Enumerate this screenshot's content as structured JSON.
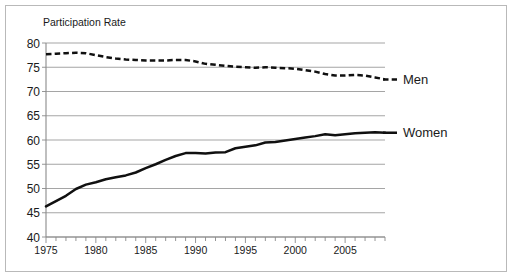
{
  "figure": {
    "title": "Participation Rate",
    "background_color": "#ffffff",
    "frame_color": "#b9b9b9",
    "line_color": "#101010",
    "grid_color": "#9b9b9b"
  },
  "chart_data": {
    "type": "line",
    "title": "Participation Rate",
    "xlabel": "",
    "ylabel": "",
    "ylim": [
      40,
      80
    ],
    "xlim": [
      1975,
      2009
    ],
    "y_ticks": [
      40,
      45,
      50,
      55,
      60,
      65,
      70,
      75,
      80
    ],
    "y_tick_labels": [
      "40",
      "45",
      "50",
      "55",
      "60",
      "65",
      "70",
      "75",
      "80"
    ],
    "x_ticks": [
      1975,
      1980,
      1985,
      1990,
      1995,
      2000,
      2005
    ],
    "x_tick_labels": [
      "1975",
      "1980",
      "1985",
      "1990",
      "1995",
      "2000",
      "2005"
    ],
    "x_minor_tick_interval": 1,
    "grid": "horizontal",
    "legend_position": "right-inline-labels",
    "x": [
      1975,
      1976,
      1977,
      1978,
      1979,
      1980,
      1981,
      1982,
      1983,
      1984,
      1985,
      1986,
      1987,
      1988,
      1989,
      1990,
      1991,
      1992,
      1993,
      1994,
      1995,
      1996,
      1997,
      1998,
      1999,
      2000,
      2001,
      2002,
      2003,
      2004,
      2005,
      2006,
      2007,
      2008,
      2009
    ],
    "series": [
      {
        "name": "Men",
        "style": "dashed",
        "color": "#101010",
        "values": [
          77.7,
          77.8,
          77.9,
          78.0,
          77.9,
          77.5,
          77.1,
          76.8,
          76.6,
          76.5,
          76.4,
          76.4,
          76.4,
          76.5,
          76.5,
          76.2,
          75.7,
          75.5,
          75.3,
          75.1,
          75.0,
          74.9,
          75.0,
          74.9,
          74.8,
          74.7,
          74.4,
          74.1,
          73.6,
          73.3,
          73.3,
          73.4,
          73.3,
          72.9,
          72.5
        ]
      },
      {
        "name": "Women",
        "style": "solid",
        "color": "#101010",
        "values": [
          46.3,
          47.4,
          48.5,
          49.9,
          50.8,
          51.3,
          51.9,
          52.3,
          52.7,
          53.3,
          54.2,
          55.0,
          55.9,
          56.7,
          57.3,
          57.3,
          57.2,
          57.4,
          57.5,
          58.3,
          58.6,
          58.9,
          59.5,
          59.6,
          59.9,
          60.2,
          60.5,
          60.8,
          61.2,
          61.0,
          61.2,
          61.4,
          61.5,
          61.6,
          61.5
        ]
      }
    ],
    "annotations": [
      {
        "label": "Men",
        "at_x": 2009,
        "at_y": 72.5
      },
      {
        "label": "Women",
        "at_x": 2009,
        "at_y": 61.5
      }
    ]
  }
}
